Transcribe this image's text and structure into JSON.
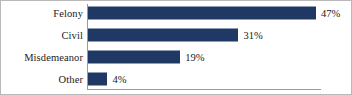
{
  "chart_data": {
    "type": "bar",
    "orientation": "horizontal",
    "title": "",
    "subtitle": "",
    "xlabel": "",
    "ylabel": "",
    "categories": [
      "Felony",
      "Civil",
      "Misdemeanor",
      "Other"
    ],
    "values": [
      47,
      31,
      19,
      4
    ],
    "value_labels": [
      "47%",
      "31%",
      "19%",
      "4%"
    ],
    "value_unit": "%",
    "xlim": [
      0,
      47
    ],
    "grid": false,
    "legend": null,
    "series": [
      {
        "name": "",
        "values": [
          47,
          31,
          19,
          4
        ]
      }
    ],
    "colors": {
      "bar": "#1f3864",
      "axis": "#9a9a9a",
      "text": "#1a1a1a",
      "frame": "#b9b9b9",
      "background": "#ffffff"
    },
    "points": [
      {
        "category": "Felony",
        "value": 47,
        "label": "47%"
      },
      {
        "category": "Civil",
        "value": 31,
        "label": "31%"
      },
      {
        "category": "Misdemeanor",
        "value": 19,
        "label": "19%"
      },
      {
        "category": "Other",
        "value": 4,
        "label": "4%"
      }
    ]
  }
}
